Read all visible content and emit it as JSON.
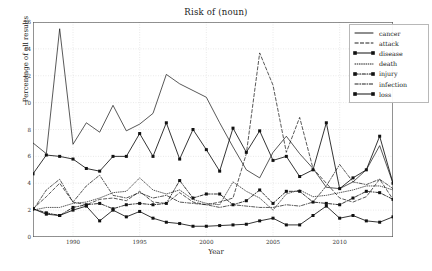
{
  "chart_data": {
    "type": "line",
    "title": "Risk of (noun)",
    "xlabel": "Year",
    "ylabel": "Percentage of all results",
    "xlim": [
      1987,
      2014
    ],
    "ylim": [
      0,
      16
    ],
    "xticks": [
      1990,
      1995,
      2000,
      2005,
      2010
    ],
    "yticks": [
      0,
      2,
      4,
      6,
      8,
      10,
      12,
      14,
      16
    ],
    "grid": true,
    "legend_position": "upper right",
    "x": [
      1987,
      1988,
      1989,
      1990,
      1991,
      1992,
      1993,
      1994,
      1995,
      1996,
      1997,
      1998,
      1999,
      2000,
      2001,
      2002,
      2003,
      2004,
      2005,
      2006,
      2007,
      2008,
      2009,
      2010,
      2011,
      2012,
      2013,
      2014
    ],
    "series": [
      {
        "name": "cancer",
        "style": "solid",
        "marker": "none",
        "values": [
          7.0,
          6.2,
          15.5,
          6.9,
          8.5,
          7.8,
          9.8,
          7.9,
          8.4,
          9.2,
          12.1,
          11.4,
          10.9,
          10.4,
          8.5,
          6.7,
          5.0,
          4.4,
          6.3,
          7.5,
          6.2,
          5.1,
          3.7,
          3.6,
          4.1,
          5.0,
          6.8,
          4.0
        ]
      },
      {
        "name": "attack",
        "style": "dashed",
        "marker": "none",
        "values": [
          2.1,
          3.0,
          4.0,
          2.6,
          2.4,
          2.8,
          2.9,
          2.7,
          3.4,
          2.6,
          2.5,
          3.3,
          2.6,
          2.4,
          2.6,
          2.9,
          6.2,
          13.7,
          11.3,
          6.3,
          8.9,
          5.1,
          4.0,
          2.9,
          2.6,
          3.0,
          4.3,
          2.8
        ]
      },
      {
        "name": "disease",
        "style": "solid",
        "marker": "square",
        "values": [
          4.7,
          6.1,
          6.0,
          5.8,
          5.1,
          4.9,
          6.0,
          6.0,
          7.7,
          6.0,
          8.5,
          5.8,
          8.0,
          6.5,
          4.9,
          8.1,
          6.3,
          7.9,
          5.7,
          6.0,
          4.5,
          5.0,
          8.5,
          3.6,
          4.4,
          5.0,
          7.5,
          4.0
        ]
      },
      {
        "name": "death",
        "style": "dotted",
        "marker": "none",
        "values": [
          2.0,
          2.2,
          2.2,
          2.5,
          2.6,
          2.9,
          3.3,
          3.4,
          4.4,
          3.5,
          3.2,
          3.5,
          2.8,
          2.5,
          2.4,
          4.1,
          3.4,
          2.9,
          2.0,
          3.2,
          3.5,
          3.0,
          3.1,
          3.3,
          3.5,
          3.8,
          3.8,
          3.5
        ]
      },
      {
        "name": "injury",
        "style": "dashdot",
        "marker": "square",
        "values": [
          2.1,
          1.8,
          1.6,
          2.2,
          2.4,
          2.5,
          2.1,
          2.4,
          2.5,
          2.4,
          2.5,
          4.2,
          2.9,
          3.2,
          3.2,
          2.4,
          2.7,
          3.5,
          2.5,
          3.4,
          3.4,
          2.6,
          2.5,
          2.4,
          2.9,
          3.4,
          3.3,
          2.8
        ]
      },
      {
        "name": "infection",
        "style": "dashdot",
        "marker": "none",
        "values": [
          2.0,
          3.5,
          4.3,
          2.6,
          3.8,
          4.6,
          3.1,
          2.9,
          3.3,
          2.9,
          3.1,
          2.6,
          2.5,
          2.4,
          2.2,
          2.4,
          2.3,
          2.2,
          2.2,
          2.4,
          2.3,
          2.6,
          3.8,
          5.4,
          4.1,
          3.9,
          4.3,
          3.6
        ]
      },
      {
        "name": "loss",
        "style": "solid",
        "marker": "square",
        "values": [
          2.1,
          1.7,
          1.6,
          2.0,
          2.3,
          1.2,
          2.0,
          1.5,
          1.9,
          1.4,
          1.1,
          1.0,
          0.8,
          0.8,
          0.85,
          0.9,
          0.95,
          1.2,
          1.4,
          0.9,
          0.9,
          1.6,
          2.3,
          1.4,
          1.6,
          1.2,
          1.1,
          1.5
        ]
      }
    ]
  }
}
